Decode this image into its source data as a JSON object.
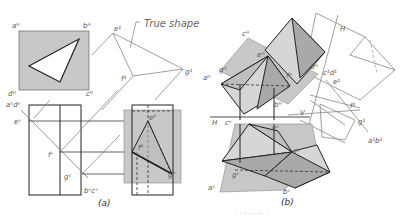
{
  "figure": {
    "annotation": "True shape",
    "captions": {
      "a": "(a)",
      "b": "(b)"
    },
    "footer_text": "· ·   ·   · ·  ··· ·"
  },
  "view_a": {
    "top_view_labels": {
      "aH": "aᴴ",
      "bH": "bᴴ",
      "cH": "cᴴ",
      "dH": "dᴴ"
    },
    "front_view_labels": {
      "aVdV": "aᵛdᵛ",
      "eV": "eᵛ",
      "fV": "fᵛ",
      "gV": "gᵛ",
      "bVcV": "bᵛcᵛ"
    },
    "profile_labels": {
      "eP": "eᴾ",
      "fP": "fᴾ",
      "gP": "gᴾ"
    },
    "aux_labels": {
      "e1": "e¹",
      "f1": "f¹",
      "g1": "g¹"
    }
  },
  "view_b": {
    "labels": {
      "cH": "cᴴ",
      "eH": "eᴴ",
      "aH": "aᴴ",
      "gH": "gᴴ",
      "fH": "fᴴ",
      "dH": "dᴴ",
      "bH": "bᴴ",
      "c1d1": "c¹d¹",
      "e1": "e¹",
      "f1": "f¹",
      "g1": "g¹",
      "a1b1": "a¹b¹",
      "H_top": "H",
      "H_fold": "H",
      "V_fold": "V",
      "cV": "cᵛ",
      "eV": "eᵛ",
      "fV": "fᵛ",
      "gV": "gᵛ",
      "aV": "aᵛ",
      "bV": "bᵛ"
    }
  },
  "colors": {
    "plane": "#c8c8c8",
    "dark_face": "#a9a9a9",
    "light_face": "#d6d6d6",
    "line": "#222222"
  }
}
